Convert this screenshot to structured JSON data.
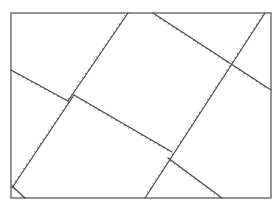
{
  "diagram": {
    "stroke_color": "#4a4a4a",
    "frame_color": "#7a7a7a",
    "background": "#ffffff",
    "line_style": "hatched",
    "line_count": 7
  }
}
